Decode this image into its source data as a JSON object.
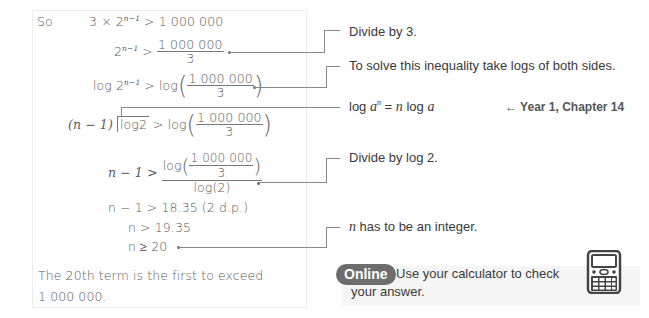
{
  "working": {
    "line1": {
      "label": "So",
      "lhs_a": "3 × 2",
      "lhs_exp": "n−1",
      "rhs": "> 1 000 000"
    },
    "line2": {
      "lhs": "2",
      "lhs_exp": "n−1",
      "op": ">",
      "num": "1 000 000",
      "den": "3"
    },
    "line3": {
      "lhs_a": "log 2",
      "lhs_exp": "n−1",
      "op": "> log",
      "num": "1 000 000",
      "den": "3"
    },
    "line4": {
      "lhs_a": "(n − 1)",
      "lhs_b": "log2",
      "op": "> log",
      "num": "1 000 000",
      "den": "3"
    },
    "line5": {
      "lhs": "n − 1 >",
      "num_prefix": "log",
      "num": "1 000 000",
      "num_den": "3",
      "den": "log(2)"
    },
    "line6": {
      "text": "n − 1 > 18.35 (2 d.p.)"
    },
    "line7": {
      "text": "n > 19.35"
    },
    "line8": {
      "text": "n ≥ 20"
    },
    "conclusion_1": "The 20th term is the first to exceed",
    "conclusion_2": "1 000 000."
  },
  "notes": {
    "divide_by_3": "Divide by 3.",
    "take_logs": "To solve this inequality take logs of both sides.",
    "log_rule_a": "log ",
    "log_rule_b": "a",
    "log_rule_sup": "n",
    "log_rule_c": " = ",
    "log_rule_d": "n",
    "log_rule_e": " log ",
    "log_rule_f": "a",
    "reference": "← Year 1, Chapter 14",
    "divide_by_log2": "Divide by log 2.",
    "integer_a": "n",
    "integer_b": " has to be an integer."
  },
  "online": {
    "badge": "Online",
    "text_1": "Use your calculator to check",
    "text_2": "your answer.",
    "icon": "calculator-icon",
    "badge_color": "#6d6d6d"
  }
}
